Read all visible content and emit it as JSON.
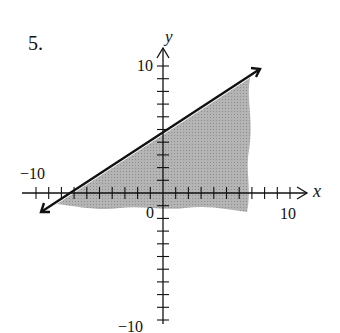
{
  "problem_number": "5.",
  "axes": {
    "x_label": "x",
    "y_label": "y",
    "x_max_label": "10",
    "x_min_label": "−10",
    "y_max_label": "10",
    "y_min_label": "−10",
    "origin_label": "0"
  },
  "chart_data": {
    "type": "line",
    "title": "5.",
    "xlabel": "x",
    "ylabel": "y",
    "xlim": [
      -10,
      10
    ],
    "ylim": [
      -10,
      10
    ],
    "tick_step": 1,
    "grid": false,
    "series": [
      {
        "name": "boundary line (solid)",
        "x": [
          -10,
          8
        ],
        "y": [
          -1,
          9.5
        ],
        "slope": 0.667,
        "y_intercept": 5,
        "x_intercept": -7.5
      }
    ],
    "shaded_region": "below the line (y <= 2/3 x + 5), shaded gray",
    "colors": {
      "shade": "#a8a8a8",
      "line": "#111111"
    }
  }
}
